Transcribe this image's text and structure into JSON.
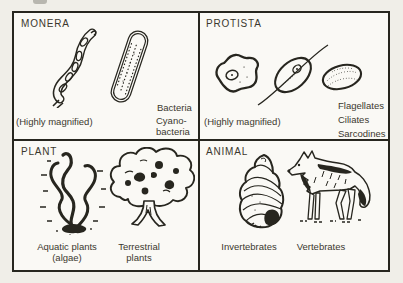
{
  "palette": {
    "page_bg": "#f0eee8",
    "panel_bg": "#faf9f5",
    "ink": "#27261f",
    "text": "#3a382e"
  },
  "quadrants": {
    "monera": {
      "title": "MONERA",
      "magnified_note": "(Highly magnified)",
      "bacteria_label": "Bacteria",
      "cyanobacteria_label": "Cyano-\nbacteria"
    },
    "protista": {
      "title": "PROTISTA",
      "magnified_note": "(Highly magnified)",
      "labels": [
        "Flagellates",
        "Ciliates",
        "Sarcodines"
      ]
    },
    "plant": {
      "title": "PLANT",
      "aquatic_label": "Aquatic plants\n(algae)",
      "terrestrial_label": "Terrestrial\nplants"
    },
    "animal": {
      "title": "ANIMAL",
      "invertebrates_label": "Invertebrates",
      "vertebrates_label": "Vertebrates"
    }
  }
}
